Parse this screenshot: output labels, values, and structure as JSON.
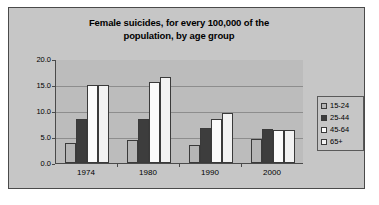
{
  "chart_data": {
    "type": "bar",
    "title": "Female suicides, for every 100,000 of the population, by age group",
    "title_line1": "Female suicides, for every 100,000 of the",
    "title_line2": "population, by age group",
    "xlabel": "",
    "ylabel": "",
    "categories": [
      "1974",
      "1980",
      "1990",
      "2000"
    ],
    "ylim": [
      0.0,
      20.0
    ],
    "yticks": [
      "0.0",
      "5.0",
      "10.0",
      "15.0",
      "20.0"
    ],
    "ytick_values": [
      0.0,
      5.0,
      10.0,
      15.0,
      20.0
    ],
    "grid": true,
    "legend_position": "right",
    "series": [
      {
        "name": "15-24",
        "color": "#b5b5b5",
        "values": [
          3.8,
          4.4,
          3.5,
          4.7
        ]
      },
      {
        "name": "25-44",
        "color": "#3d3d3d",
        "values": [
          8.4,
          8.4,
          6.7,
          6.5
        ]
      },
      {
        "name": "45-64",
        "color": "#fbfbfb",
        "values": [
          15.0,
          15.6,
          8.5,
          6.4
        ]
      },
      {
        "name": "65+",
        "color": "#f2f2f2",
        "values": [
          15.0,
          16.6,
          9.7,
          6.3
        ]
      }
    ]
  },
  "theme": {
    "chart_background": "#c6c6c6",
    "plot_background": "#bcbcbc",
    "gridline_color": "#8d8d8d",
    "axis_color": "#4a4a4a",
    "border_color": "#4a4a4a",
    "text_color": "#000000"
  }
}
